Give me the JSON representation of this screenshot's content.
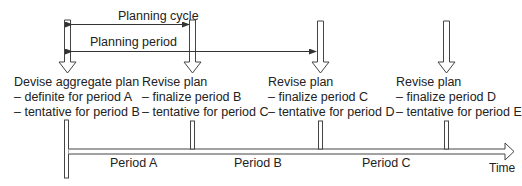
{
  "diagram": {
    "planning_cycle_label": "Planning cycle",
    "planning_period_label": "Planning period",
    "milestones": [
      {
        "title": "Devise aggregate plan",
        "line1": "– definite for period A",
        "line2": "– tentative for period B"
      },
      {
        "title": "Revise plan",
        "line1": "– finalize period B",
        "line2": "– tentative for period C"
      },
      {
        "title": "Revise plan",
        "line1": "– finalize period C",
        "line2": "– tentative for period D"
      },
      {
        "title": "Revise plan",
        "line1": "– finalize period D",
        "line2": "– tentative for period E"
      }
    ],
    "periods": [
      "Period A",
      "Period B",
      "Period C"
    ],
    "axis_label": "Time"
  }
}
